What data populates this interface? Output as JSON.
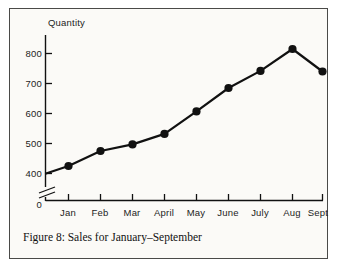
{
  "figure": {
    "caption": "Figure 8: Sales for January–September",
    "border_color": "#4a4a48",
    "background_color": "#fbfaf7"
  },
  "chart_data": {
    "type": "line",
    "title": "",
    "xlabel": "",
    "ylabel": "Quantity",
    "categories": [
      "Jan",
      "Feb",
      "Mar",
      "April",
      "May",
      "June",
      "July",
      "Aug",
      "Sept"
    ],
    "values": [
      425,
      475,
      497,
      532,
      607,
      685,
      742,
      815,
      740
    ],
    "series": [
      {
        "name": "Sales",
        "values": [
          425,
          475,
          497,
          532,
          607,
          685,
          742,
          815,
          740
        ]
      }
    ],
    "ytick_labels": [
      "800",
      "700",
      "600",
      "500",
      "400",
      "0"
    ],
    "ytick_values": [
      800,
      700,
      600,
      500,
      400,
      0
    ],
    "ylim": [
      400,
      860
    ],
    "axis_break": true,
    "grid": false,
    "legend": false,
    "legend_position": "none",
    "marker": "filled-circle",
    "line_color": "#111111",
    "marker_color": "#111111"
  }
}
